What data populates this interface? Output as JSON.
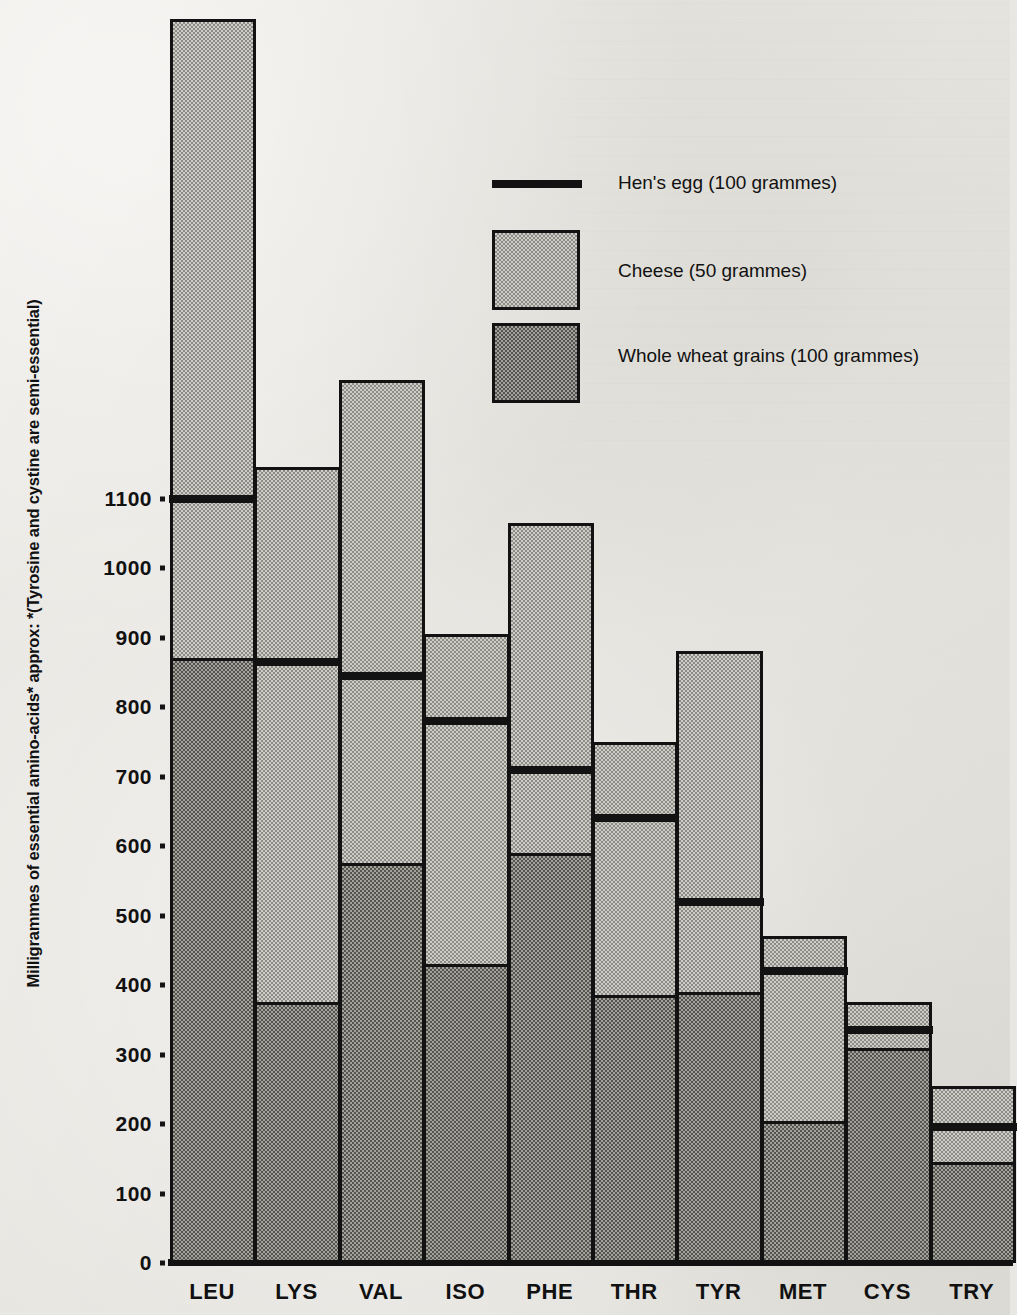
{
  "chart_data": {
    "type": "bar",
    "title": "",
    "subtitle": "",
    "xlabel": "",
    "ylabel": "Milligrammes of essential amino-acids* approx: *(Tyrosine and cystine are semi-essential)",
    "ylim": [
      0,
      1200
    ],
    "ytick_values": [
      0,
      100,
      200,
      300,
      400,
      500,
      600,
      700,
      800,
      900,
      1000,
      1100
    ],
    "ytick_labels": [
      "0",
      "100",
      "200",
      "300",
      "400",
      "500",
      "600",
      "700",
      "800",
      "900",
      "1000",
      "1100"
    ],
    "grid": false,
    "legend_position": "upper-right-inside",
    "categories": [
      "LEU",
      "LYS",
      "VAL",
      "ISO",
      "PHE",
      "THR",
      "TYR",
      "MET",
      "CYS",
      "TRY"
    ],
    "series": [
      {
        "name": "Cheese (50 grammes)",
        "style": "light-stipple-box",
        "values": [
          1790,
          1145,
          1270,
          905,
          1065,
          750,
          880,
          470,
          375,
          255
        ]
      },
      {
        "name": "Whole wheat grains (100 grammes)",
        "style": "dark-stipple-box",
        "values": [
          870,
          375,
          575,
          430,
          590,
          385,
          390,
          205,
          310,
          145
        ]
      },
      {
        "name": "Hen's egg (100 grammes)",
        "style": "thick-black-line",
        "values": [
          1100,
          865,
          845,
          780,
          710,
          640,
          520,
          420,
          335,
          195
        ]
      }
    ]
  },
  "axis": {
    "y_title": "Milligrammes of essential amino-acids* approx: *(Tyrosine and cystine are semi-essential)"
  },
  "legend": {
    "items": [
      {
        "label": "Hen's egg (100 grammes)",
        "swatch": "line"
      },
      {
        "label": "Cheese (50 grammes)",
        "swatch": "cheese"
      },
      {
        "label": "Whole wheat grains (100 grammes)",
        "swatch": "wheat"
      }
    ]
  }
}
